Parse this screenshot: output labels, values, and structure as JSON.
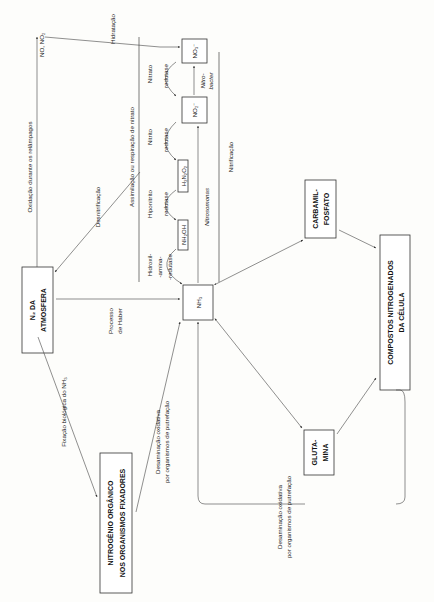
{
  "figure": {
    "orientation": "rotated 90 degrees counter-clockwise"
  },
  "nodes": {
    "n2_atmosfera": {
      "line1": "N₂ DA",
      "line2": "ATMOSFERA"
    },
    "nitrogenio_organico": {
      "line1": "NITROGÊNIO ORGÂNICO",
      "line2": "NOS ORGANISMOS FIXADORES"
    },
    "nh3": {
      "label": "NH₃"
    },
    "nh2oh": {
      "label": "NH₂OH"
    },
    "h2n2o2": {
      "label": "H₂N₂O₂"
    },
    "no2": {
      "label": "NO₂⁻"
    },
    "no3": {
      "label": "NO₃⁻"
    },
    "no_no2": {
      "label": "NO, NO₂"
    },
    "carbamil_fosfato": {
      "line1": "CARBAMIL-",
      "line2": "FOSFATO"
    },
    "glutamina": {
      "line1": "GLUTA-",
      "line2": "MINA"
    },
    "compostos": {
      "line1": "COMPOSTOS NITROGENADOS",
      "line2": "DA CÉLULA"
    }
  },
  "processes": {
    "oxidacao": "Oxidação durante os relâmpagos",
    "hidratacao": "Hidratação",
    "desnitrificacao": "Desnitrificação",
    "assimilacao": "Assimilação ou respiração de nitrato",
    "nitrificacao": "Nitrificação",
    "haber_line1": "Processo",
    "haber_line2": "de Haber",
    "fixacao": "Fixação biológica do NH₃",
    "desaminacao1_line1": "Desaminação oxidativa",
    "desaminacao1_line2": "por organismos de putrefação",
    "desaminacao2_line1": "Desaminação oxidativa",
    "desaminacao2_line2": "por organismos de putrefação",
    "nitrosomonas": "Nitrosomonas",
    "nitrobacter_line1": "Nitro-",
    "nitrobacter_line2": "bacter"
  },
  "enzymes": {
    "hidroxilamina": {
      "line1": "Hidroxil-",
      "line2": "-amina-",
      "line3": "-redutase"
    },
    "hiponitrito": {
      "line1": "Hiponitrito",
      "line2": "redutase"
    },
    "nitrito": {
      "line1": "Nitrito",
      "line2": "redutase"
    },
    "nitrato": {
      "line1": "Nitrato",
      "line2": "redutase"
    }
  },
  "colors": {
    "ink": "#222222",
    "paper": "#fdfdfb",
    "line": "#444444"
  }
}
